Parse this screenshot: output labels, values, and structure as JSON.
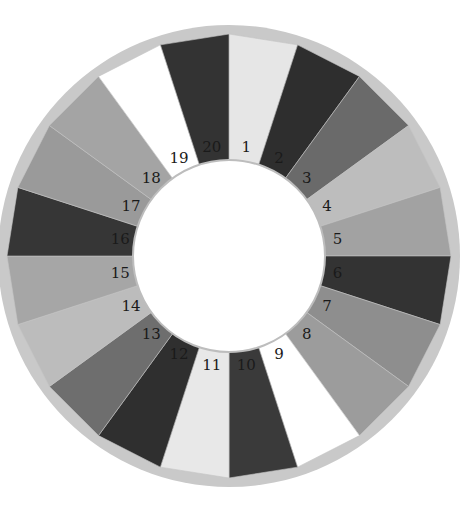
{
  "wheel": {
    "center": [
      229,
      256
    ],
    "rim_radius": 231,
    "outer_radius": 222,
    "inner_radius": 96,
    "label_radius": 110,
    "rim_color": "#c9c9c9",
    "hole_color": "#ffffff",
    "segments": [
      {
        "label": "1",
        "color": "#e6e6e6"
      },
      {
        "label": "2",
        "color": "#2e2e2e"
      },
      {
        "label": "3",
        "color": "#6a6a6a"
      },
      {
        "label": "4",
        "color": "#bdbdbd"
      },
      {
        "label": "5",
        "color": "#a2a2a2"
      },
      {
        "label": "6",
        "color": "#333333"
      },
      {
        "label": "7",
        "color": "#8e8e8e"
      },
      {
        "label": "8",
        "color": "#9c9c9c"
      },
      {
        "label": "9",
        "color": "#ffffff"
      },
      {
        "label": "10",
        "color": "#3a3a3a"
      },
      {
        "label": "11",
        "color": "#e8e8e8"
      },
      {
        "label": "12",
        "color": "#2f2f2f"
      },
      {
        "label": "13",
        "color": "#6e6e6e"
      },
      {
        "label": "14",
        "color": "#bcbcbc"
      },
      {
        "label": "15",
        "color": "#a6a6a6"
      },
      {
        "label": "16",
        "color": "#363636"
      },
      {
        "label": "17",
        "color": "#9a9a9a"
      },
      {
        "label": "18",
        "color": "#a4a4a4"
      },
      {
        "label": "19",
        "color": "#ffffff"
      },
      {
        "label": "20",
        "color": "#333333"
      }
    ]
  }
}
